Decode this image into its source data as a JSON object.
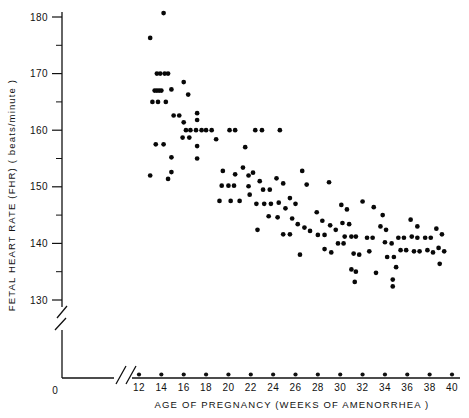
{
  "chart_data": {
    "type": "scatter",
    "title": "",
    "xlabel": "AGE OF PREGNANCY (WEEKS OF AMENORRHEA )",
    "ylabel": "FETAL HEART RATE (FHR) ( beats/minute )",
    "xlim": [
      11,
      40
    ],
    "ylim": [
      128,
      182
    ],
    "xticks": [
      12,
      14,
      16,
      18,
      20,
      22,
      24,
      26,
      28,
      30,
      32,
      34,
      36,
      38,
      40
    ],
    "xticklabels": [
      "12",
      "14",
      "16",
      "18",
      "20",
      "22",
      "24",
      "26",
      "28",
      "30",
      "32",
      "34",
      "36",
      "38",
      "40"
    ],
    "yticks": [
      130,
      140,
      150,
      160,
      170,
      180
    ],
    "yticklabels": [
      "130",
      "140",
      "150",
      "160",
      "170",
      "180"
    ],
    "y_minor_ticks": [
      135,
      145,
      155,
      165,
      175
    ],
    "origin_label": "0",
    "grid": false,
    "legend": null,
    "x_axis_break": true,
    "y_axis_break": true,
    "series": [
      {
        "name": "FHR observations",
        "marker": "filled-circle",
        "color": "#080808",
        "points": [
          [
            13.0,
            176.3
          ],
          [
            14.2,
            180.7
          ],
          [
            13.6,
            170.0
          ],
          [
            13.9,
            170.0
          ],
          [
            14.3,
            170.0
          ],
          [
            14.6,
            170.0
          ],
          [
            13.4,
            167.0
          ],
          [
            13.6,
            167.0
          ],
          [
            13.8,
            167.0
          ],
          [
            14.0,
            167.0
          ],
          [
            13.2,
            165.0
          ],
          [
            13.7,
            165.0
          ],
          [
            14.4,
            165.0
          ],
          [
            14.9,
            167.2
          ],
          [
            16.4,
            166.3
          ],
          [
            15.1,
            162.6
          ],
          [
            15.6,
            162.6
          ],
          [
            16.0,
            161.4
          ],
          [
            15.9,
            158.7
          ],
          [
            16.5,
            158.7
          ],
          [
            13.5,
            157.5
          ],
          [
            14.2,
            157.5
          ],
          [
            14.9,
            155.2
          ],
          [
            14.9,
            152.6
          ],
          [
            13.0,
            152.0
          ],
          [
            14.6,
            151.4
          ],
          [
            16.0,
            168.5
          ],
          [
            17.2,
            163.0
          ],
          [
            17.2,
            161.8
          ],
          [
            17.1,
            160.0
          ],
          [
            17.6,
            160.0
          ],
          [
            18.0,
            160.0
          ],
          [
            18.5,
            160.0
          ],
          [
            16.2,
            160.0
          ],
          [
            16.6,
            160.0
          ],
          [
            17.2,
            157.2
          ],
          [
            17.2,
            155.0
          ],
          [
            20.1,
            160.0
          ],
          [
            20.6,
            160.0
          ],
          [
            21.5,
            157.0
          ],
          [
            19.5,
            152.8
          ],
          [
            20.6,
            152.2
          ],
          [
            19.4,
            150.2
          ],
          [
            20.0,
            150.2
          ],
          [
            20.5,
            150.2
          ],
          [
            21.3,
            153.4
          ],
          [
            21.8,
            152.0
          ],
          [
            21.8,
            150.1
          ],
          [
            21.9,
            148.6
          ],
          [
            19.2,
            147.5
          ],
          [
            20.2,
            147.5
          ],
          [
            21.0,
            147.5
          ],
          [
            22.4,
            160.0
          ],
          [
            23.0,
            160.0
          ],
          [
            24.6,
            160.0
          ],
          [
            22.2,
            152.5
          ],
          [
            22.8,
            151.0
          ],
          [
            23.1,
            149.5
          ],
          [
            23.7,
            149.5
          ],
          [
            22.5,
            147.0
          ],
          [
            23.2,
            147.0
          ],
          [
            23.8,
            147.0
          ],
          [
            24.3,
            151.5
          ],
          [
            24.9,
            150.6
          ],
          [
            24.5,
            147.2
          ],
          [
            25.1,
            146.2
          ],
          [
            23.6,
            144.8
          ],
          [
            24.4,
            144.6
          ],
          [
            25.5,
            148.0
          ],
          [
            26.0,
            147.0
          ],
          [
            25.7,
            144.4
          ],
          [
            26.2,
            143.4
          ],
          [
            26.8,
            142.8
          ],
          [
            27.3,
            142.2
          ],
          [
            24.9,
            141.6
          ],
          [
            25.5,
            141.6
          ],
          [
            22.6,
            142.4
          ],
          [
            26.4,
            138.0
          ],
          [
            27.9,
            145.5
          ],
          [
            28.4,
            144.0
          ],
          [
            28.0,
            141.5
          ],
          [
            28.6,
            141.5
          ],
          [
            29.1,
            143.2
          ],
          [
            29.6,
            142.4
          ],
          [
            28.6,
            139.0
          ],
          [
            29.2,
            138.4
          ],
          [
            30.1,
            146.8
          ],
          [
            30.6,
            146.0
          ],
          [
            30.2,
            143.6
          ],
          [
            30.8,
            143.4
          ],
          [
            30.4,
            141.2
          ],
          [
            31.0,
            141.2
          ],
          [
            31.4,
            141.2
          ],
          [
            29.8,
            140.0
          ],
          [
            30.3,
            140.0
          ],
          [
            31.2,
            138.2
          ],
          [
            31.7,
            138.0
          ],
          [
            31.0,
            135.4
          ],
          [
            31.4,
            135.0
          ],
          [
            31.3,
            133.2
          ],
          [
            32.4,
            141.0
          ],
          [
            32.9,
            141.0
          ],
          [
            32.6,
            138.6
          ],
          [
            33.2,
            134.8
          ],
          [
            33.6,
            143.0
          ],
          [
            34.1,
            142.4
          ],
          [
            34.0,
            140.2
          ],
          [
            34.6,
            140.0
          ],
          [
            34.2,
            137.6
          ],
          [
            34.8,
            137.6
          ],
          [
            35.2,
            141.0
          ],
          [
            35.7,
            141.0
          ],
          [
            35.4,
            138.8
          ],
          [
            35.9,
            138.8
          ],
          [
            35.0,
            135.8
          ],
          [
            34.7,
            133.6
          ],
          [
            34.7,
            132.4
          ],
          [
            36.3,
            144.2
          ],
          [
            36.9,
            143.0
          ],
          [
            36.4,
            141.2
          ],
          [
            36.9,
            141.0
          ],
          [
            36.6,
            138.6
          ],
          [
            37.1,
            138.6
          ],
          [
            37.6,
            141.0
          ],
          [
            38.1,
            141.0
          ],
          [
            37.8,
            138.8
          ],
          [
            38.3,
            138.4
          ],
          [
            38.6,
            142.6
          ],
          [
            39.1,
            141.6
          ],
          [
            38.8,
            139.2
          ],
          [
            39.3,
            138.6
          ],
          [
            38.9,
            136.4
          ],
          [
            33.8,
            145.0
          ],
          [
            27.0,
            150.4
          ],
          [
            18.9,
            158.4
          ],
          [
            26.6,
            152.8
          ],
          [
            29.0,
            150.8
          ],
          [
            32.0,
            147.4
          ],
          [
            33.0,
            146.4
          ]
        ]
      }
    ]
  }
}
